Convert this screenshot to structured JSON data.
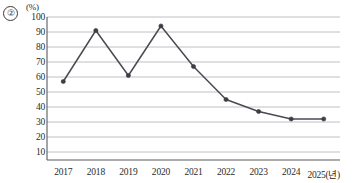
{
  "item_marker": "②",
  "unit_label": "(%)",
  "colors": {
    "line": "#4a4a52",
    "marker": "#3d3d45",
    "gridline": "#b9b9bd",
    "axis": "#5b5b5b",
    "text": "#2b2b2b"
  },
  "chart_data": {
    "type": "line",
    "title": "",
    "xlabel": "",
    "ylabel": "",
    "unit": "(%)",
    "categories": [
      "2017",
      "2018",
      "2019",
      "2020",
      "2021",
      "2022",
      "2023",
      "2024",
      "2025"
    ],
    "x_tick_labels": [
      "2017",
      "2018",
      "2019",
      "2020",
      "2021",
      "2022",
      "2023",
      "2024",
      "2025(년)"
    ],
    "values": [
      57,
      91,
      61,
      94,
      67,
      45,
      37,
      32,
      32
    ],
    "y_tick_labels": [
      "100",
      "90",
      "80",
      "70",
      "60",
      "50",
      "40",
      "30",
      "20",
      "10"
    ],
    "y_ticks": [
      100,
      90,
      80,
      70,
      60,
      50,
      40,
      30,
      20,
      10
    ],
    "ylim": [
      0,
      100
    ],
    "grid": true,
    "legend": false,
    "markers": true
  }
}
